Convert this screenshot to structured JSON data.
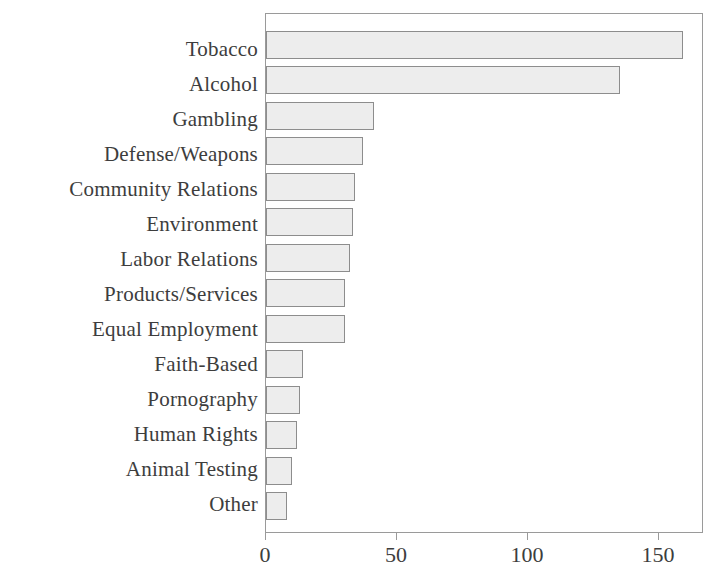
{
  "chart_data": {
    "type": "bar",
    "orientation": "horizontal",
    "title": "",
    "subtitle": "",
    "xlabel": "",
    "ylabel": "",
    "categories": [
      "Tobacco",
      "Alcohol",
      "Gambling",
      "Defense/Weapons",
      "Community Relations",
      "Environment",
      "Labor Relations",
      "Products/Services",
      "Equal Employment",
      "Faith-Based",
      "Pornography",
      "Human Rights",
      "Animal Testing",
      "Other"
    ],
    "values": [
      159,
      135,
      41,
      37,
      34,
      33,
      32,
      30,
      30,
      14,
      13,
      12,
      10,
      8
    ],
    "xlim": [
      0,
      167
    ],
    "xticks": [
      0,
      50,
      100,
      150
    ],
    "xticklabels": [
      "0",
      "50",
      "100",
      "150"
    ],
    "grid": false,
    "legend": null,
    "bar_fill_color": "#ededed",
    "bar_edge_color": "#8d8d8d",
    "axis_color": "#9a9a9a",
    "text_color": "#3d3d3d",
    "background_color": "#ffffff"
  }
}
